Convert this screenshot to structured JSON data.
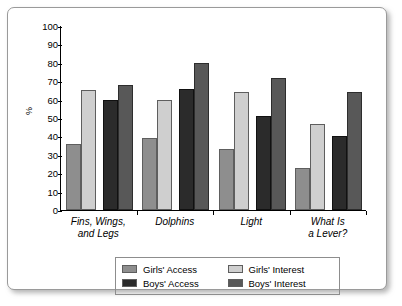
{
  "chart_data": {
    "type": "bar",
    "title": "",
    "xlabel": "",
    "ylabel": "%",
    "ylim": [
      0,
      100
    ],
    "ytick_step": 10,
    "yticks": [
      "100",
      "90",
      "80",
      "70",
      "60",
      "50",
      "40",
      "30",
      "20",
      "10",
      "0"
    ],
    "grid": false,
    "legend_position": "bottom",
    "categories": [
      "Fins, Wings,\nand Legs",
      "Dolphins",
      "Light",
      "What Is\na Lever?"
    ],
    "category_lines": [
      [
        "Fins, Wings,",
        "and Legs"
      ],
      [
        "Dolphins",
        ""
      ],
      [
        "Light",
        ""
      ],
      [
        "What Is",
        "a Lever?"
      ]
    ],
    "series": [
      {
        "name": "Girls' Access",
        "color": "#8e8e8e",
        "values": [
          36,
          39,
          33,
          23
        ]
      },
      {
        "name": "Girls' Interest",
        "color": "#cfcfcf",
        "values": [
          65,
          60,
          64,
          47
        ]
      },
      {
        "name": "Boys' Access",
        "color": "#2b2b2b",
        "values": [
          60,
          66,
          51,
          40
        ]
      },
      {
        "name": "Boys' Interest",
        "color": "#585858",
        "values": [
          68,
          80,
          72,
          64
        ]
      }
    ]
  },
  "legend": {
    "items": [
      {
        "label": "Girls' Access"
      },
      {
        "label": "Girls' Interest"
      },
      {
        "label": "Boys' Access"
      },
      {
        "label": "Boys' Interest"
      }
    ]
  }
}
